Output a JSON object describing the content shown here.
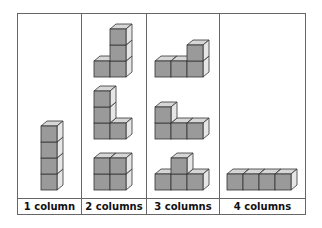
{
  "diagram": {
    "colors": {
      "front": "#9a9a9a",
      "top": "#d6d6d6",
      "side": "#e6e6e6",
      "edge": "#333333",
      "grid": "#666666"
    },
    "columns": [
      {
        "label": "1 column",
        "figures": [
          {
            "name": "tower-of-4",
            "cubes": [
              [
                0,
                0
              ],
              [
                0,
                1
              ],
              [
                0,
                2
              ],
              [
                0,
                3
              ]
            ]
          }
        ]
      },
      {
        "label": "2 columns",
        "figures": [
          {
            "name": "L-shape-3-tall",
            "cubes": [
              [
                0,
                0
              ],
              [
                1,
                0
              ],
              [
                1,
                1
              ],
              [
                1,
                2
              ]
            ]
          },
          {
            "name": "L-shape-3-left",
            "cubes": [
              [
                0,
                0
              ],
              [
                0,
                1
              ],
              [
                0,
                2
              ],
              [
                1,
                0
              ]
            ]
          },
          {
            "name": "square-2x2",
            "cubes": [
              [
                0,
                0
              ],
              [
                1,
                0
              ],
              [
                0,
                1
              ],
              [
                1,
                1
              ]
            ]
          }
        ]
      },
      {
        "label": "3 columns",
        "figures": [
          {
            "name": "L-right-up",
            "cubes": [
              [
                0,
                0
              ],
              [
                1,
                0
              ],
              [
                2,
                0
              ],
              [
                2,
                1
              ]
            ]
          },
          {
            "name": "L-left-up",
            "cubes": [
              [
                0,
                0
              ],
              [
                1,
                0
              ],
              [
                2,
                0
              ],
              [
                0,
                1
              ]
            ]
          },
          {
            "name": "T-shape",
            "cubes": [
              [
                0,
                0
              ],
              [
                1,
                0
              ],
              [
                2,
                0
              ],
              [
                1,
                1
              ]
            ]
          }
        ]
      },
      {
        "label": "4 columns",
        "figures": [
          {
            "name": "row-of-4",
            "cubes": [
              [
                0,
                0
              ],
              [
                1,
                0
              ],
              [
                2,
                0
              ],
              [
                3,
                0
              ]
            ]
          }
        ]
      }
    ]
  }
}
